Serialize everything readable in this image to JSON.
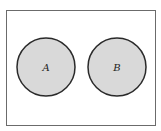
{
  "diagram": {
    "type": "venn",
    "title": "",
    "frame": {
      "x": 6,
      "y": 10,
      "width": 149,
      "height": 115,
      "stroke": "#6b6b6b"
    },
    "sets": [
      {
        "label": "A",
        "cx": 46,
        "cy": 67,
        "r": 29,
        "fill": "#d9d9d9",
        "stroke": "#2a2a2a"
      },
      {
        "label": "B",
        "cx": 117,
        "cy": 67,
        "r": 29,
        "fill": "#d9d9d9",
        "stroke": "#2a2a2a"
      }
    ],
    "relationship": "disjoint"
  }
}
